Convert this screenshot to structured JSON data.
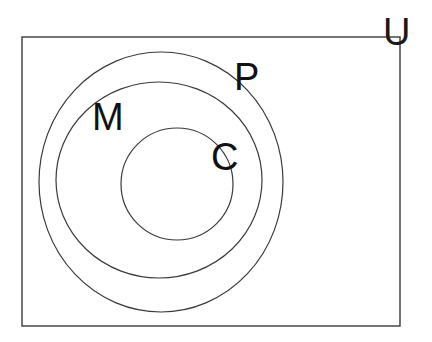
{
  "figure": {
    "kind": "euler-diagram",
    "background_color": "#ffffff",
    "width": 432,
    "height": 342
  },
  "universe": {
    "label": "U",
    "shape": "rectangle",
    "stroke_color": "#3a3a3a",
    "stroke_width": 1.4,
    "fill": "none",
    "geometry": {
      "x": 22,
      "y": 37,
      "width": 378,
      "height": 289
    },
    "label_position": {
      "x": 383,
      "y": 45
    },
    "label_font_size": 38,
    "label_color": "#1a1a1a"
  },
  "sets": [
    {
      "id": "P",
      "label": "P",
      "shape": "ellipse",
      "level": 1,
      "stroke_color": "#3a3a3a",
      "stroke_width": 1.2,
      "fill": "none",
      "geometry": {
        "cx": 161,
        "cy": 182,
        "rx": 122,
        "ry": 130
      },
      "label_position": {
        "x": 234,
        "y": 90
      },
      "label_font_size": 38,
      "label_color": "#111111"
    },
    {
      "id": "M",
      "label": "M",
      "shape": "ellipse",
      "level": 2,
      "stroke_color": "#3a3a3a",
      "stroke_width": 1.2,
      "fill": "none",
      "geometry": {
        "cx": 159,
        "cy": 180,
        "rx": 103,
        "ry": 98
      },
      "label_position": {
        "x": 92,
        "y": 130
      },
      "label_font_size": 38,
      "label_color": "#111111"
    },
    {
      "id": "C",
      "label": "C",
      "shape": "ellipse",
      "level": 3,
      "stroke_color": "#3a3a3a",
      "stroke_width": 1.2,
      "fill": "none",
      "geometry": {
        "cx": 177,
        "cy": 184,
        "rx": 56,
        "ry": 56
      },
      "label_position": {
        "x": 211,
        "y": 170
      },
      "label_font_size": 38,
      "label_color": "#111111"
    }
  ]
}
